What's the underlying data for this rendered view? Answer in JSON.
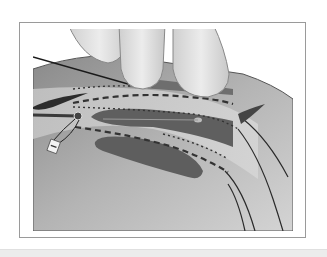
{
  "figure": {
    "palette": {
      "background": "#ffffff",
      "frame_border": "#9a9a9a",
      "tissue_light": "#b8b8b8",
      "tissue_mid": "#8f8f8f",
      "tissue_dark": "#5e5e5e",
      "finger": "#dcdcdc",
      "line_dark": "#2a2a2a",
      "bottom_band": "#ececec"
    }
  }
}
